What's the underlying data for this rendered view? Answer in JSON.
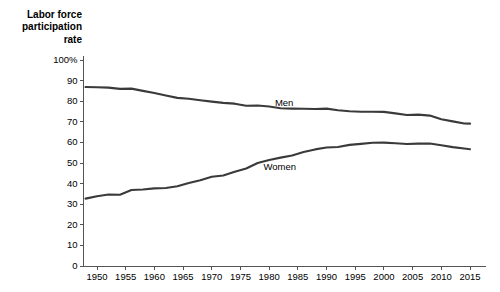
{
  "chart_data": {
    "type": "line",
    "title": "Labor force\nparticipation\nrate",
    "xlabel": "",
    "ylabel": "Labor force participation rate",
    "xlim": [
      1948,
      2016
    ],
    "ylim": [
      0,
      100
    ],
    "grid": false,
    "legend": "inline-labels",
    "line_color": "#3a3a3a",
    "axis_color": "#555555",
    "x_ticks": [
      1950,
      1955,
      1960,
      1965,
      1970,
      1975,
      1980,
      1985,
      1990,
      1995,
      2000,
      2005,
      2010,
      2015
    ],
    "x_tick_labels": [
      "1950",
      "1955",
      "1960",
      "1965",
      "1970",
      "1975",
      "1980",
      "1985",
      "1990",
      "1995",
      "2000",
      "2005",
      "2010",
      "2015"
    ],
    "y_ticks": [
      0,
      10,
      20,
      30,
      40,
      50,
      60,
      70,
      80,
      90,
      100
    ],
    "y_tick_labels": [
      "0",
      "10",
      "20",
      "30",
      "40",
      "50",
      "60",
      "70",
      "80",
      "90",
      "100%"
    ],
    "series": [
      {
        "name": "Men",
        "label": "Men",
        "label_x": 1981,
        "label_y": 79,
        "x": [
          1948,
          1950,
          1952,
          1954,
          1956,
          1958,
          1960,
          1962,
          1964,
          1966,
          1968,
          1970,
          1972,
          1974,
          1976,
          1978,
          1980,
          1982,
          1984,
          1986,
          1988,
          1990,
          1992,
          1994,
          1996,
          1998,
          2000,
          2002,
          2004,
          2006,
          2008,
          2010,
          2012,
          2014,
          2015
        ],
        "values": [
          86.9,
          86.8,
          86.6,
          86.0,
          86.1,
          85.0,
          84.0,
          82.8,
          81.6,
          81.2,
          80.5,
          79.8,
          79.2,
          78.8,
          77.8,
          77.9,
          77.4,
          76.6,
          76.4,
          76.3,
          76.2,
          76.4,
          75.6,
          75.1,
          74.9,
          74.9,
          74.8,
          74.1,
          73.3,
          73.5,
          73.0,
          71.2,
          70.2,
          69.2,
          69.1
        ]
      },
      {
        "name": "Women",
        "label": "Women",
        "label_x": 1979,
        "label_y": 48,
        "x": [
          1948,
          1950,
          1952,
          1954,
          1956,
          1958,
          1960,
          1962,
          1964,
          1966,
          1968,
          1970,
          1972,
          1974,
          1976,
          1978,
          1980,
          1982,
          1984,
          1986,
          1988,
          1990,
          1992,
          1994,
          1996,
          1998,
          2000,
          2002,
          2004,
          2006,
          2008,
          2010,
          2012,
          2014,
          2015
        ],
        "values": [
          32.7,
          33.9,
          34.7,
          34.6,
          36.9,
          37.1,
          37.7,
          37.9,
          38.7,
          40.3,
          41.6,
          43.3,
          43.9,
          45.7,
          47.3,
          50.0,
          51.5,
          52.6,
          53.6,
          55.3,
          56.6,
          57.5,
          57.8,
          58.8,
          59.3,
          59.8,
          59.9,
          59.6,
          59.2,
          59.4,
          59.5,
          58.6,
          57.7,
          57.0,
          56.7
        ]
      }
    ]
  }
}
